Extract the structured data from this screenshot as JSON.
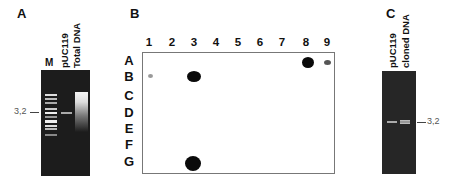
{
  "panels": {
    "A": {
      "letter": "A",
      "lane_labels": [
        "M",
        "pUC119",
        "Total DNA"
      ],
      "size_marker": "3,2"
    },
    "B": {
      "letter": "B",
      "columns": [
        "1",
        "2",
        "3",
        "4",
        "5",
        "6",
        "7",
        "8",
        "9"
      ],
      "rows": [
        "A",
        "B",
        "C",
        "D",
        "E",
        "F",
        "G"
      ],
      "spots": [
        {
          "row": "A",
          "col": "8",
          "intensity": "strong"
        },
        {
          "row": "A",
          "col": "9",
          "intensity": "weak"
        },
        {
          "row": "B",
          "col": "1",
          "intensity": "faint"
        },
        {
          "row": "B",
          "col": "3",
          "intensity": "strong"
        },
        {
          "row": "G",
          "col": "3",
          "intensity": "strong"
        }
      ]
    },
    "C": {
      "letter": "C",
      "lane_labels": [
        "pUC119",
        "cloned DNA"
      ],
      "size_marker": "3,2"
    }
  },
  "colors": {
    "gel_background": "#1c1c1c",
    "band": "#e8e8e8",
    "spot": "#0a0a0a",
    "blot_border": "#777777"
  }
}
